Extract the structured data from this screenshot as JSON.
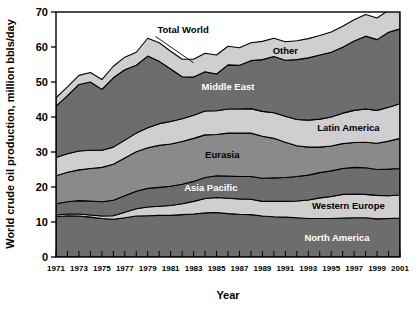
{
  "chart_data": {
    "type": "area",
    "stacked": true,
    "title": "",
    "xlabel": "Year",
    "ylabel": "World crude oil production, million bbls/day",
    "xlim": [
      1971,
      2001
    ],
    "ylim": [
      0,
      70
    ],
    "ytick_step": 10,
    "yticks": [
      0,
      10,
      20,
      30,
      40,
      50,
      60,
      70
    ],
    "ytick_labels": [
      "0",
      "10",
      "20",
      "30",
      "40",
      "50",
      "60",
      "70"
    ],
    "xticks_all_years": true,
    "grid": false,
    "legend": "inline band labels",
    "x": [
      1971,
      1972,
      1973,
      1974,
      1975,
      1976,
      1977,
      1978,
      1979,
      1980,
      1981,
      1982,
      1983,
      1984,
      1985,
      1986,
      1987,
      1988,
      1989,
      1990,
      1991,
      1992,
      1993,
      1994,
      1995,
      1996,
      1997,
      1998,
      1999,
      2000,
      2001
    ],
    "xtick_labels": [
      "1971",
      "1973",
      "1975",
      "1977",
      "1979",
      "1981",
      "1983",
      "1985",
      "1987",
      "1989",
      "1991",
      "1993",
      "1995",
      "1997",
      "1999",
      "2001"
    ],
    "series": [
      {
        "name": "North America",
        "label": "North America",
        "fill": "#6d6d6d",
        "label_color": "light",
        "values": [
          11.5,
          11.8,
          11.7,
          11.4,
          11.0,
          10.8,
          11.2,
          11.7,
          11.8,
          11.9,
          11.9,
          12.1,
          12.3,
          12.6,
          12.7,
          12.4,
          12.2,
          12.1,
          11.7,
          11.5,
          11.4,
          11.2,
          11.0,
          11.0,
          11.0,
          11.1,
          11.2,
          11.2,
          10.9,
          11.0,
          11.1
        ]
      },
      {
        "name": "Western Europe",
        "label": "Western Europe",
        "fill": "#cfcfcf",
        "label_color": "dark",
        "values": [
          0.5,
          0.5,
          0.6,
          0.6,
          0.7,
          1.0,
          1.6,
          2.1,
          2.5,
          2.6,
          2.8,
          3.1,
          3.6,
          4.1,
          4.3,
          4.4,
          4.4,
          4.4,
          4.2,
          4.4,
          4.5,
          4.8,
          5.3,
          5.9,
          6.3,
          6.8,
          6.8,
          6.7,
          6.7,
          6.5,
          6.6
        ]
      },
      {
        "name": "Asia Pacific",
        "label": "Asia Pacific",
        "fill": "#6d6d6d",
        "label_color": "light",
        "values": [
          3.2,
          3.5,
          3.8,
          4.0,
          4.1,
          4.4,
          4.7,
          5.0,
          5.3,
          5.4,
          5.5,
          5.6,
          5.7,
          6.0,
          6.2,
          6.3,
          6.4,
          6.5,
          6.6,
          6.7,
          6.8,
          7.0,
          7.1,
          7.2,
          7.3,
          7.4,
          7.6,
          7.6,
          7.4,
          7.6,
          7.6
        ]
      },
      {
        "name": "Eurasia",
        "label": "Eurasia",
        "fill": "#8a8a8a",
        "label_color": "dark",
        "values": [
          8.0,
          8.4,
          8.8,
          9.3,
          9.8,
          10.3,
          10.8,
          11.3,
          11.6,
          12.0,
          12.1,
          12.2,
          12.3,
          12.2,
          11.8,
          12.3,
          12.4,
          12.4,
          12.0,
          11.3,
          10.1,
          8.8,
          8.0,
          7.3,
          7.1,
          7.1,
          7.1,
          7.3,
          7.5,
          8.0,
          8.6
        ]
      },
      {
        "name": "Latin America",
        "label": "Latin America",
        "fill": "#cfcfcf",
        "label_color": "dark",
        "values": [
          5.2,
          5.3,
          5.4,
          5.2,
          4.9,
          4.9,
          5.1,
          5.3,
          5.7,
          6.2,
          6.4,
          6.5,
          6.6,
          6.8,
          6.8,
          6.9,
          6.9,
          7.0,
          7.1,
          7.3,
          7.4,
          7.5,
          7.7,
          8.0,
          8.3,
          8.7,
          9.2,
          9.5,
          9.4,
          9.7,
          9.9
        ]
      },
      {
        "name": "Middle East",
        "label": "Middle East",
        "fill": "#6d6d6d",
        "label_color": "light",
        "values": [
          14.7,
          16.6,
          19.0,
          19.5,
          17.4,
          19.8,
          20.1,
          19.4,
          20.5,
          17.8,
          15.0,
          12.0,
          10.9,
          11.2,
          10.5,
          12.6,
          12.5,
          13.7,
          14.8,
          16.1,
          16.0,
          17.1,
          17.8,
          18.3,
          18.5,
          18.8,
          19.8,
          20.8,
          20.2,
          21.4,
          21.4
        ]
      },
      {
        "name": "Other",
        "label": "Other",
        "fill": "#cfcfcf",
        "label_color": "dark",
        "values": [
          2.4,
          2.5,
          2.6,
          2.7,
          2.8,
          3.3,
          3.6,
          3.7,
          5.1,
          5.3,
          5.1,
          5.0,
          5.1,
          5.3,
          5.4,
          5.3,
          5.0,
          5.1,
          5.2,
          5.2,
          5.3,
          5.4,
          5.5,
          5.6,
          5.8,
          6.0,
          6.1,
          6.2,
          6.2,
          6.3,
          6.3
        ]
      }
    ],
    "totals": [
      45.5,
      48.6,
      51.9,
      52.7,
      50.7,
      54.5,
      57.1,
      58.5,
      62.5,
      61.2,
      58.8,
      56.5,
      56.5,
      58.2,
      57.7,
      60.2,
      59.8,
      61.2,
      61.6,
      62.5,
      61.5,
      61.8,
      62.4,
      63.3,
      64.3,
      65.9,
      67.8,
      69.3,
      68.3,
      70.5,
      71.5
    ],
    "annotations": [
      {
        "name": "total-world",
        "label": "Total World",
        "points_to_year": 1983,
        "points_to_value": 55.5
      }
    ]
  }
}
